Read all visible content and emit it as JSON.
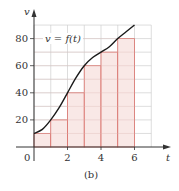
{
  "chart_data": {
    "type": "line",
    "title": "",
    "caption": "(b)",
    "xlabel": "t",
    "ylabel": "v",
    "annotation": "v = f(t)",
    "xlim": [
      0,
      7
    ],
    "ylim": [
      0,
      90
    ],
    "grid": true,
    "x_ticks": [
      2,
      4,
      6
    ],
    "y_ticks": [
      20,
      40,
      60,
      80
    ],
    "origin_label": "0",
    "series": [
      {
        "name": "v = f(t)",
        "type": "line",
        "x": [
          0,
          0.5,
          1,
          1.5,
          2,
          2.5,
          3,
          3.5,
          4,
          4.5,
          5,
          5.5,
          6
        ],
        "values": [
          10,
          13,
          20,
          29,
          40,
          51,
          60,
          66,
          70,
          74,
          80,
          85,
          90
        ]
      },
      {
        "name": "left-endpoint rectangles",
        "type": "bar",
        "intervals": [
          [
            0,
            1
          ],
          [
            1,
            2
          ],
          [
            2,
            3
          ],
          [
            3,
            4
          ],
          [
            4,
            5
          ],
          [
            5,
            6
          ]
        ],
        "values": [
          10,
          20,
          40,
          60,
          70,
          80
        ]
      }
    ],
    "legend": "none"
  },
  "colors": {
    "grid": "#cfcfcf",
    "rect_fill": "#f8e4e2",
    "rect_edge": "#d9706a",
    "curve": "#1a1a1a",
    "axis": "#333333"
  }
}
